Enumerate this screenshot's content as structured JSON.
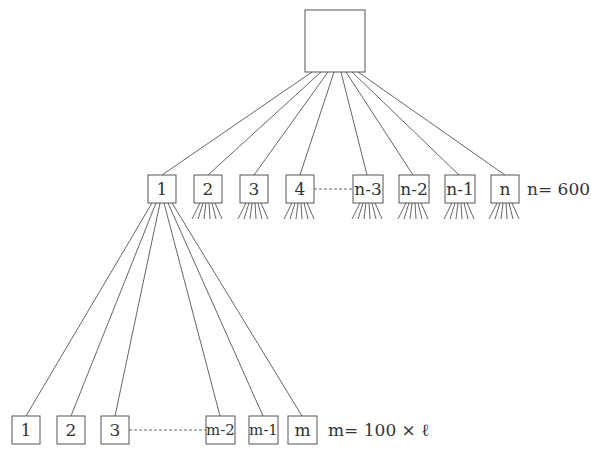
{
  "diagram": {
    "type": "tree",
    "root": {
      "label": ""
    },
    "level1": {
      "nodes": [
        "1",
        "2",
        "3",
        "4",
        "n-3",
        "n-2",
        "n-1",
        "n"
      ],
      "ellipsis_between": [
        "4",
        "n-3"
      ],
      "annotation": "n= 600"
    },
    "level2": {
      "parent": "1",
      "nodes": [
        "1",
        "2",
        "3",
        "m-2",
        "m-1",
        "m"
      ],
      "ellipsis_between": [
        "3",
        "m-2"
      ],
      "annotation": "m= 100 × ℓ"
    },
    "colors": {
      "stroke": "#555555",
      "text": "#333333",
      "background": "#ffffff"
    }
  }
}
